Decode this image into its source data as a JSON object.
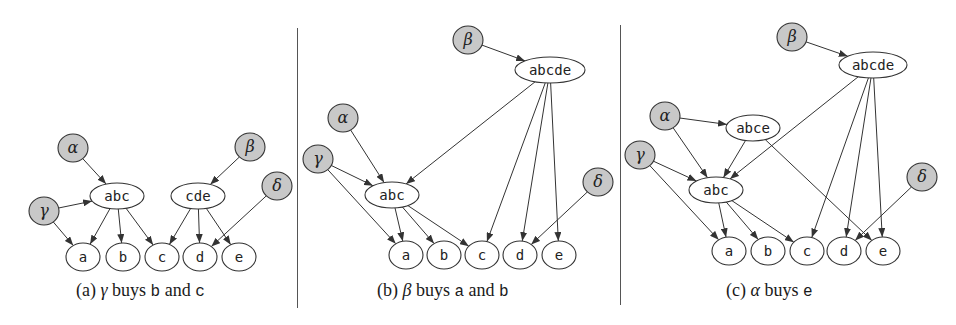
{
  "figure": {
    "colors": {
      "background": "#ffffff",
      "stroke": "#333333",
      "agent_fill": "#c8c8c8",
      "bundle_fill": "#ffffff",
      "divider": "#555555"
    },
    "panels": [
      {
        "id": "a",
        "caption": {
          "label": "(a)",
          "agent": "γ",
          "verb": "buys",
          "item1": "b",
          "conj": "and",
          "item2": "c",
          "left": 76
        },
        "nodes": [
          {
            "id": "alpha",
            "label": "α",
            "kind": "agent",
            "x": 73,
            "y": 148,
            "rx": 15,
            "ry": 14
          },
          {
            "id": "beta",
            "label": "β",
            "kind": "agent",
            "x": 250,
            "y": 147,
            "rx": 15,
            "ry": 14
          },
          {
            "id": "gamma",
            "label": "γ",
            "kind": "agent",
            "x": 44,
            "y": 211,
            "rx": 15,
            "ry": 14
          },
          {
            "id": "delta",
            "label": "δ",
            "kind": "agent",
            "x": 277,
            "y": 186,
            "rx": 15,
            "ry": 14
          },
          {
            "id": "abc",
            "label": "abc",
            "kind": "bundle",
            "x": 117,
            "y": 196,
            "rx": 27,
            "ry": 13
          },
          {
            "id": "cde",
            "label": "cde",
            "kind": "bundle",
            "x": 198,
            "y": 196,
            "rx": 27,
            "ry": 13
          },
          {
            "id": "a",
            "label": "a",
            "kind": "item",
            "x": 83,
            "y": 257,
            "rx": 17,
            "ry": 14
          },
          {
            "id": "b",
            "label": "b",
            "kind": "item",
            "x": 123,
            "y": 257,
            "rx": 17,
            "ry": 14
          },
          {
            "id": "c",
            "label": "c",
            "kind": "item",
            "x": 162,
            "y": 257,
            "rx": 17,
            "ry": 14
          },
          {
            "id": "d",
            "label": "d",
            "kind": "item",
            "x": 200,
            "y": 257,
            "rx": 17,
            "ry": 14
          },
          {
            "id": "e",
            "label": "e",
            "kind": "item",
            "x": 239,
            "y": 257,
            "rx": 17,
            "ry": 14
          }
        ],
        "edges": [
          [
            "alpha",
            "abc"
          ],
          [
            "gamma",
            "abc"
          ],
          [
            "gamma",
            "a"
          ],
          [
            "beta",
            "cde"
          ],
          [
            "delta",
            "d"
          ],
          [
            "abc",
            "a"
          ],
          [
            "abc",
            "b"
          ],
          [
            "abc",
            "c"
          ],
          [
            "cde",
            "c"
          ],
          [
            "cde",
            "d"
          ],
          [
            "cde",
            "e"
          ]
        ]
      },
      {
        "id": "b",
        "caption": {
          "label": "(b)",
          "agent": "β",
          "verb": "buys",
          "item1": "a",
          "conj": "and",
          "item2": "b",
          "left": 377
        },
        "nodes": [
          {
            "id": "beta",
            "label": "β",
            "kind": "agent",
            "x": 468,
            "y": 40,
            "rx": 15,
            "ry": 14
          },
          {
            "id": "alpha",
            "label": "α",
            "kind": "agent",
            "x": 343,
            "y": 118,
            "rx": 15,
            "ry": 14
          },
          {
            "id": "gamma",
            "label": "γ",
            "kind": "agent",
            "x": 318,
            "y": 159,
            "rx": 15,
            "ry": 14
          },
          {
            "id": "delta",
            "label": "δ",
            "kind": "agent",
            "x": 598,
            "y": 182,
            "rx": 15,
            "ry": 14
          },
          {
            "id": "abcde",
            "label": "abcde",
            "kind": "bundle",
            "x": 550,
            "y": 70,
            "rx": 35,
            "ry": 13
          },
          {
            "id": "abc",
            "label": "abc",
            "kind": "bundle",
            "x": 392,
            "y": 195,
            "rx": 27,
            "ry": 13
          },
          {
            "id": "a",
            "label": "a",
            "kind": "item",
            "x": 406,
            "y": 255,
            "rx": 17,
            "ry": 14
          },
          {
            "id": "b",
            "label": "b",
            "kind": "item",
            "x": 444,
            "y": 255,
            "rx": 17,
            "ry": 14
          },
          {
            "id": "c",
            "label": "c",
            "kind": "item",
            "x": 482,
            "y": 255,
            "rx": 17,
            "ry": 14
          },
          {
            "id": "d",
            "label": "d",
            "kind": "item",
            "x": 520,
            "y": 255,
            "rx": 17,
            "ry": 14
          },
          {
            "id": "e",
            "label": "e",
            "kind": "item",
            "x": 559,
            "y": 255,
            "rx": 17,
            "ry": 14
          }
        ],
        "edges": [
          [
            "beta",
            "abcde"
          ],
          [
            "alpha",
            "abc"
          ],
          [
            "gamma",
            "abc"
          ],
          [
            "gamma",
            "a"
          ],
          [
            "abcde",
            "abc"
          ],
          [
            "abcde",
            "c"
          ],
          [
            "abcde",
            "d"
          ],
          [
            "abcde",
            "e"
          ],
          [
            "delta",
            "d"
          ],
          [
            "abc",
            "a"
          ],
          [
            "abc",
            "b"
          ],
          [
            "abc",
            "c"
          ]
        ]
      },
      {
        "id": "c",
        "caption": {
          "label": "(c)",
          "agent": "α",
          "verb": "buys",
          "item1": "e",
          "conj": "",
          "item2": "",
          "left": 726
        },
        "nodes": [
          {
            "id": "beta",
            "label": "β",
            "kind": "agent",
            "x": 792,
            "y": 37,
            "rx": 15,
            "ry": 14
          },
          {
            "id": "alpha",
            "label": "α",
            "kind": "agent",
            "x": 665,
            "y": 116,
            "rx": 15,
            "ry": 14
          },
          {
            "id": "gamma",
            "label": "γ",
            "kind": "agent",
            "x": 640,
            "y": 155,
            "rx": 15,
            "ry": 14
          },
          {
            "id": "delta",
            "label": "δ",
            "kind": "agent",
            "x": 922,
            "y": 177,
            "rx": 15,
            "ry": 14
          },
          {
            "id": "abcde",
            "label": "abcde",
            "kind": "bundle",
            "x": 873,
            "y": 65,
            "rx": 34,
            "ry": 13
          },
          {
            "id": "abce",
            "label": "abce",
            "kind": "bundle",
            "x": 753,
            "y": 128,
            "rx": 27,
            "ry": 13
          },
          {
            "id": "abc",
            "label": "abc",
            "kind": "bundle",
            "x": 716,
            "y": 190,
            "rx": 27,
            "ry": 13
          },
          {
            "id": "a",
            "label": "a",
            "kind": "item",
            "x": 729,
            "y": 251,
            "rx": 17,
            "ry": 14
          },
          {
            "id": "b",
            "label": "b",
            "kind": "item",
            "x": 768,
            "y": 251,
            "rx": 17,
            "ry": 14
          },
          {
            "id": "c",
            "label": "c",
            "kind": "item",
            "x": 807,
            "y": 251,
            "rx": 17,
            "ry": 14
          },
          {
            "id": "d",
            "label": "d",
            "kind": "item",
            "x": 844,
            "y": 251,
            "rx": 17,
            "ry": 14
          },
          {
            "id": "e",
            "label": "e",
            "kind": "item",
            "x": 883,
            "y": 251,
            "rx": 17,
            "ry": 14
          }
        ],
        "edges": [
          [
            "beta",
            "abcde"
          ],
          [
            "alpha",
            "abce"
          ],
          [
            "alpha",
            "abc"
          ],
          [
            "gamma",
            "abc"
          ],
          [
            "gamma",
            "a"
          ],
          [
            "abce",
            "abc"
          ],
          [
            "abce",
            "e"
          ],
          [
            "abcde",
            "abc"
          ],
          [
            "abcde",
            "c"
          ],
          [
            "abcde",
            "d"
          ],
          [
            "abcde",
            "e"
          ],
          [
            "delta",
            "d"
          ],
          [
            "abc",
            "a"
          ],
          [
            "abc",
            "b"
          ],
          [
            "abc",
            "c"
          ]
        ]
      }
    ],
    "dividers": [
      {
        "x": 297,
        "top": 28,
        "bottom": 308
      },
      {
        "x": 620,
        "top": 25,
        "bottom": 305
      }
    ]
  }
}
